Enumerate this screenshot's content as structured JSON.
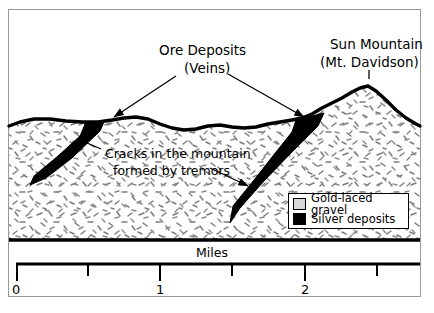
{
  "figure": {
    "type": "geological-cross-section"
  },
  "annotations": {
    "ore_deposits": {
      "line1": "Ore Deposits",
      "line2": "(Veins)"
    },
    "sun_mountain": {
      "line1": "Sun Mountain",
      "line2": "(Mt. Davidson)"
    },
    "cracks": {
      "line1": "Cracks in the mountain",
      "line2": "formed by tremors"
    }
  },
  "legend": {
    "items": [
      {
        "label": "Gold-laced gravel",
        "color": "#d8d8d8",
        "swatch": "gray-box"
      },
      {
        "label": "Silver deposits",
        "color": "#000000",
        "swatch": "black-box"
      }
    ]
  },
  "scale": {
    "label": "Miles",
    "tick_labels": [
      "0",
      "1",
      "2"
    ],
    "major_ticks": [
      0,
      1,
      2
    ],
    "minor_ticks": [
      0.5,
      1.5,
      2.5
    ],
    "unit": "miles"
  },
  "colors": {
    "ink": "#000000",
    "frame": "#9a9a9a",
    "gravel_fill": "#ffffff",
    "stipple": "#7d7d7d",
    "vein": "#000000",
    "background": "#ffffff"
  }
}
